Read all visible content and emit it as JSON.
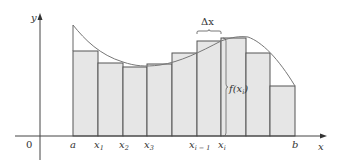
{
  "figure": {
    "type": "riemann-sum-diagram",
    "axis_labels": {
      "x": "x",
      "y": "y",
      "origin": "0"
    },
    "tick_labels": [
      {
        "main": "a",
        "sub": ""
      },
      {
        "main": "x",
        "sub": "1"
      },
      {
        "main": "x",
        "sub": "2"
      },
      {
        "main": "x",
        "sub": "3"
      },
      {
        "main": "x",
        "sub": "i − 1"
      },
      {
        "main": "x",
        "sub": "i"
      },
      {
        "main": "b",
        "sub": ""
      }
    ],
    "delta_label": "Δx",
    "height_label": {
      "main": "f(x",
      "sub": "i",
      "close": ")"
    },
    "colors": {
      "rect_fill": "#e6e6e6",
      "rect_stroke": "#555555",
      "curve": "#777777",
      "axis": "#444444",
      "text": "#333333"
    },
    "rectangles": [
      {
        "x0": 73,
        "x1": 98,
        "top": 51
      },
      {
        "x0": 98,
        "x1": 123,
        "top": 63
      },
      {
        "x0": 123,
        "x1": 147,
        "top": 67
      },
      {
        "x0": 147,
        "x1": 172,
        "top": 64
      },
      {
        "x0": 172,
        "x1": 197,
        "top": 53
      },
      {
        "x0": 197,
        "x1": 221,
        "top": 41
      },
      {
        "x0": 221,
        "x1": 246,
        "top": 38
      },
      {
        "x0": 246,
        "x1": 270,
        "top": 53
      },
      {
        "x0": 270,
        "x1": 295,
        "top": 86
      }
    ],
    "n_subintervals": 9
  }
}
